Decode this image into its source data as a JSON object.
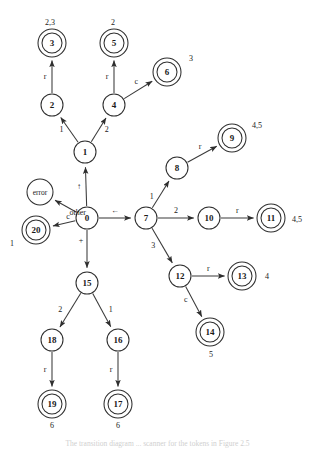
{
  "figure": {
    "caption": "The transition diagram ... scanner for the tokens in Figure 2.5",
    "background_color": "#ffffff",
    "stroke_color": "#2e2e2e",
    "edge_color": "#3a3a3a"
  },
  "nodes": [
    {
      "id": "error",
      "label": "error",
      "x": 40,
      "y": 192,
      "r": 13,
      "accepting": false,
      "small": true,
      "annotation": "",
      "annotation_dx": 0,
      "annotation_dy": 0
    },
    {
      "id": "3",
      "label": "3",
      "x": 52,
      "y": 43,
      "r": 10,
      "accepting": true,
      "small": false,
      "annotation": "2,3",
      "annotation_dx": -2,
      "annotation_dy": -21
    },
    {
      "id": "5",
      "label": "5",
      "x": 114,
      "y": 43,
      "r": 10,
      "accepting": true,
      "small": false,
      "annotation": "2",
      "annotation_dx": -1,
      "annotation_dy": -21
    },
    {
      "id": "6",
      "label": "6",
      "x": 167,
      "y": 72,
      "r": 10,
      "accepting": true,
      "small": false,
      "annotation": "3",
      "annotation_dx": 24,
      "annotation_dy": -14
    },
    {
      "id": "2",
      "label": "2",
      "x": 52,
      "y": 105,
      "r": 11,
      "accepting": false,
      "small": false,
      "annotation": "",
      "annotation_dx": 0,
      "annotation_dy": 0
    },
    {
      "id": "4",
      "label": "4",
      "x": 114,
      "y": 105,
      "r": 11,
      "accepting": false,
      "small": false,
      "annotation": "",
      "annotation_dx": 0,
      "annotation_dy": 0
    },
    {
      "id": "9",
      "label": "9",
      "x": 232,
      "y": 138,
      "r": 10,
      "accepting": true,
      "small": false,
      "annotation": "4,5",
      "annotation_dx": 25,
      "annotation_dy": -13
    },
    {
      "id": "1",
      "label": "1",
      "x": 85,
      "y": 152,
      "r": 11,
      "accepting": false,
      "small": false,
      "annotation": "",
      "annotation_dx": 0,
      "annotation_dy": 0
    },
    {
      "id": "8",
      "label": "8",
      "x": 177,
      "y": 168,
      "r": 11,
      "accepting": false,
      "small": false,
      "annotation": "",
      "annotation_dx": 0,
      "annotation_dy": 0
    },
    {
      "id": "0",
      "label": "0",
      "x": 87,
      "y": 218,
      "r": 11,
      "accepting": false,
      "small": false,
      "annotation": "",
      "annotation_dx": 0,
      "annotation_dy": 0
    },
    {
      "id": "7",
      "label": "7",
      "x": 146,
      "y": 218,
      "r": 11,
      "accepting": false,
      "small": false,
      "annotation": "",
      "annotation_dx": 0,
      "annotation_dy": 0
    },
    {
      "id": "10",
      "label": "10",
      "x": 209,
      "y": 218,
      "r": 11,
      "accepting": false,
      "small": false,
      "annotation": "",
      "annotation_dx": 0,
      "annotation_dy": 0
    },
    {
      "id": "11",
      "label": "11",
      "x": 271,
      "y": 218,
      "r": 10,
      "accepting": true,
      "small": false,
      "annotation": "4,5",
      "annotation_dx": 26,
      "annotation_dy": 1
    },
    {
      "id": "20",
      "label": "20",
      "x": 36,
      "y": 230,
      "r": 10,
      "accepting": true,
      "small": false,
      "annotation": "1",
      "annotation_dx": -24,
      "annotation_dy": 13
    },
    {
      "id": "12",
      "label": "12",
      "x": 180,
      "y": 276,
      "r": 11,
      "accepting": false,
      "small": false,
      "annotation": "",
      "annotation_dx": 0,
      "annotation_dy": 0
    },
    {
      "id": "13",
      "label": "13",
      "x": 242,
      "y": 276,
      "r": 10,
      "accepting": true,
      "small": false,
      "annotation": "4",
      "annotation_dx": 25,
      "annotation_dy": 0
    },
    {
      "id": "15",
      "label": "15",
      "x": 87,
      "y": 283,
      "r": 11,
      "accepting": false,
      "small": false,
      "annotation": "",
      "annotation_dx": 0,
      "annotation_dy": 0
    },
    {
      "id": "14",
      "label": "14",
      "x": 210,
      "y": 332,
      "r": 10,
      "accepting": true,
      "small": false,
      "annotation": "5",
      "annotation_dx": 1,
      "annotation_dy": 22
    },
    {
      "id": "18",
      "label": "18",
      "x": 52,
      "y": 340,
      "r": 11,
      "accepting": false,
      "small": false,
      "annotation": "",
      "annotation_dx": 0,
      "annotation_dy": 0
    },
    {
      "id": "16",
      "label": "16",
      "x": 118,
      "y": 340,
      "r": 11,
      "accepting": false,
      "small": false,
      "annotation": "",
      "annotation_dx": 0,
      "annotation_dy": 0
    },
    {
      "id": "19",
      "label": "19",
      "x": 52,
      "y": 404,
      "r": 10,
      "accepting": true,
      "small": false,
      "annotation": "6",
      "annotation_dx": 0,
      "annotation_dy": 21
    },
    {
      "id": "17",
      "label": "17",
      "x": 118,
      "y": 404,
      "r": 10,
      "accepting": true,
      "small": false,
      "annotation": "6",
      "annotation_dx": 0,
      "annotation_dy": 21
    }
  ],
  "edges": [
    {
      "from": "2",
      "to": "3",
      "label": "r",
      "label_dx": -7,
      "label_dy": 0
    },
    {
      "from": "4",
      "to": "5",
      "label": "r",
      "label_dx": -7,
      "label_dy": 0
    },
    {
      "from": "4",
      "to": "6",
      "label": "c",
      "label_dx": -2,
      "label_dy": -8
    },
    {
      "from": "1",
      "to": "2",
      "label": "1",
      "label_dx": -8,
      "label_dy": 0
    },
    {
      "from": "1",
      "to": "4",
      "label": "2",
      "label_dx": 8,
      "label_dy": 0
    },
    {
      "from": "0",
      "to": "1",
      "label": "↑",
      "label_dx": -7,
      "label_dy": 0
    },
    {
      "from": "0",
      "to": "error",
      "label": "other",
      "label_dx": 12,
      "label_dy": 6
    },
    {
      "from": "0",
      "to": "20",
      "label": "c",
      "label_dx": 4,
      "label_dy": -7
    },
    {
      "from": "0",
      "to": "7",
      "label": "←",
      "label_dx": 0,
      "label_dy": -8
    },
    {
      "from": "0",
      "to": "15",
      "label": "+",
      "label_dx": -6,
      "label_dy": -8
    },
    {
      "from": "7",
      "to": "8",
      "label": "1",
      "label_dx": -9,
      "label_dy": 2
    },
    {
      "from": "7",
      "to": "10",
      "label": "2",
      "label_dx": 0,
      "label_dy": -8
    },
    {
      "from": "7",
      "to": "12",
      "label": "3",
      "label_dx": -9,
      "label_dy": 0
    },
    {
      "from": "8",
      "to": "9",
      "label": "r",
      "label_dx": -2,
      "label_dy": -8
    },
    {
      "from": "10",
      "to": "11",
      "label": "r",
      "label_dx": 0,
      "label_dy": -8
    },
    {
      "from": "12",
      "to": "13",
      "label": "r",
      "label_dx": 0,
      "label_dy": -8
    },
    {
      "from": "12",
      "to": "14",
      "label": "c",
      "label_dx": -8,
      "label_dy": -2
    },
    {
      "from": "15",
      "to": "18",
      "label": "2",
      "label_dx": -10,
      "label_dy": -1
    },
    {
      "from": "15",
      "to": "16",
      "label": "1",
      "label_dx": 9,
      "label_dy": -1
    },
    {
      "from": "18",
      "to": "19",
      "label": "r",
      "label_dx": -7,
      "label_dy": 0
    },
    {
      "from": "16",
      "to": "17",
      "label": "r",
      "label_dx": -7,
      "label_dy": 0
    }
  ]
}
